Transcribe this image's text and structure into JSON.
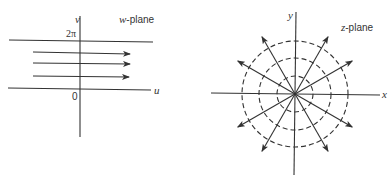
{
  "w_plane": {
    "title_var": "w",
    "title_suffix": "-plane",
    "axis_h": "u",
    "axis_v": "v",
    "top_line_label": "2π",
    "origin_label": "0",
    "arrow_count": 3
  },
  "z_plane": {
    "title_var": "z",
    "title_suffix": "-plane",
    "axis_h": "x",
    "axis_v": "y",
    "ray_angles_deg": [
      30,
      60,
      120,
      150,
      210,
      240,
      300,
      330
    ],
    "dashed_circle_radii_px": [
      18,
      36,
      53
    ]
  },
  "colors": {
    "ink": "#333333",
    "background": "#ffffff"
  }
}
